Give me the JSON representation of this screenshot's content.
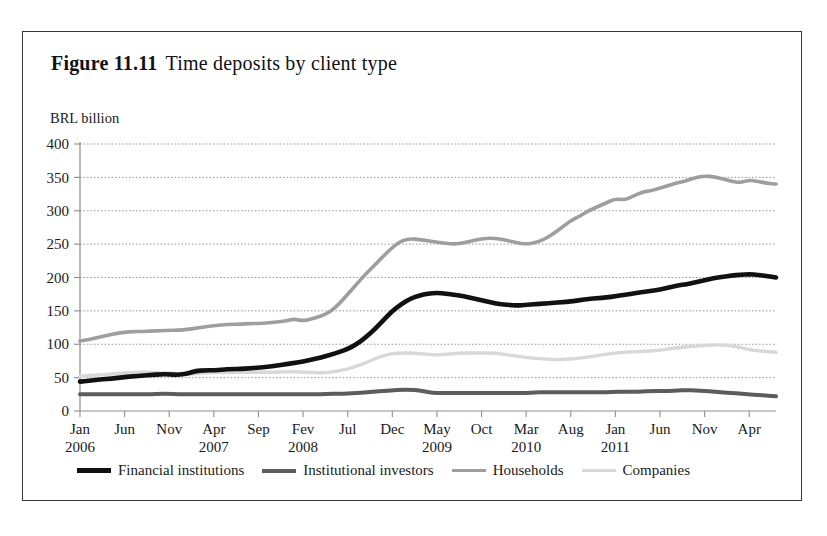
{
  "figure": {
    "number": "Figure 11.11",
    "caption": "Time deposits by client type"
  },
  "axis_unit_label": "BRL billion",
  "colors": {
    "financial_institutions": "#111111",
    "institutional_investors": "#5c5c5c",
    "households": "#9e9e9e",
    "companies": "#d8d8d8",
    "grid": "#9a9a9a",
    "axis": "#8d8d8d",
    "border": "#3a3a3a",
    "background": "#ffffff"
  },
  "legend": {
    "items": [
      {
        "label": "Financial institutions",
        "color": "#111111",
        "thickness": 4.5
      },
      {
        "label": "Institutional investors",
        "color": "#5c5c5c",
        "thickness": 4.0
      },
      {
        "label": "Households",
        "color": "#9e9e9e",
        "thickness": 3.5
      },
      {
        "label": "Companies",
        "color": "#d8d8d8",
        "thickness": 3.5
      }
    ]
  },
  "chart_data": {
    "type": "line",
    "title": "Time deposits by client type",
    "xlabel": "",
    "ylabel": "BRL billion",
    "ylim": [
      0,
      400
    ],
    "ytick_values": [
      0,
      50,
      100,
      150,
      200,
      250,
      300,
      350,
      400
    ],
    "grid": true,
    "legend_position": "bottom",
    "x_tick_labels": [
      {
        "month": "Jan",
        "year": "2006",
        "index": 0
      },
      {
        "month": "Jun",
        "year": "",
        "index": 5
      },
      {
        "month": "Nov",
        "year": "",
        "index": 10
      },
      {
        "month": "Apr",
        "year": "2007",
        "index": 15
      },
      {
        "month": "Sep",
        "year": "",
        "index": 20
      },
      {
        "month": "Fev",
        "year": "2008",
        "index": 25
      },
      {
        "month": "Jul",
        "year": "",
        "index": 30
      },
      {
        "month": "Dec",
        "year": "",
        "index": 35
      },
      {
        "month": "May",
        "year": "2009",
        "index": 40
      },
      {
        "month": "Oct",
        "year": "",
        "index": 45
      },
      {
        "month": "Mar",
        "year": "2010",
        "index": 50
      },
      {
        "month": "Aug",
        "year": "",
        "index": 55
      },
      {
        "month": "Jan",
        "year": "2011",
        "index": 60
      },
      {
        "month": "Jun",
        "year": "",
        "index": 65
      },
      {
        "month": "Nov",
        "year": "",
        "index": 70
      },
      {
        "month": "Apr",
        "year": "",
        "index": 75
      }
    ],
    "n_points": 79,
    "series": [
      {
        "name": "Financial institutions",
        "color": "#111111",
        "values": [
          44,
          45,
          47,
          48,
          49,
          51,
          52,
          53,
          54,
          55,
          55,
          54,
          56,
          60,
          61,
          61,
          62,
          63,
          63,
          64,
          65,
          66,
          68,
          70,
          72,
          74,
          77,
          80,
          84,
          88,
          93,
          100,
          110,
          122,
          136,
          150,
          160,
          168,
          173,
          176,
          177,
          176,
          174,
          172,
          169,
          166,
          163,
          160,
          159,
          158,
          159,
          160,
          161,
          162,
          163,
          164,
          166,
          168,
          169,
          170,
          172,
          174,
          176,
          178,
          180,
          182,
          185,
          188,
          190,
          193,
          196,
          199,
          201,
          203,
          204,
          205,
          204,
          202,
          200
        ]
      },
      {
        "name": "Institutional investors",
        "color": "#5c5c5c",
        "values": [
          25,
          25,
          25,
          25,
          25,
          25,
          25,
          25,
          25,
          26,
          26,
          25,
          25,
          25,
          25,
          25,
          25,
          25,
          25,
          25,
          25,
          25,
          25,
          25,
          25,
          25,
          25,
          25,
          26,
          26,
          26,
          27,
          28,
          29,
          30,
          31,
          32,
          32,
          31,
          28,
          27,
          27,
          27,
          27,
          27,
          27,
          27,
          27,
          27,
          27,
          27,
          28,
          28,
          28,
          28,
          28,
          28,
          28,
          28,
          28,
          29,
          29,
          29,
          29,
          30,
          30,
          30,
          31,
          31,
          31,
          30,
          29,
          28,
          27,
          26,
          25,
          24,
          23,
          22
        ]
      },
      {
        "name": "Households",
        "color": "#9e9e9e",
        "values": [
          105,
          107,
          110,
          113,
          116,
          118,
          119,
          119,
          120,
          120,
          121,
          121,
          122,
          124,
          126,
          128,
          129,
          130,
          130,
          131,
          131,
          132,
          133,
          135,
          138,
          135,
          138,
          142,
          148,
          160,
          175,
          190,
          205,
          218,
          232,
          245,
          255,
          258,
          257,
          255,
          253,
          251,
          250,
          252,
          255,
          258,
          259,
          258,
          255,
          252,
          250,
          252,
          257,
          265,
          275,
          285,
          292,
          300,
          306,
          312,
          318,
          316,
          322,
          328,
          330,
          334,
          338,
          342,
          345,
          350,
          352,
          351,
          348,
          344,
          342,
          346,
          344,
          341,
          340
        ]
      },
      {
        "name": "Companies",
        "color": "#d8d8d8",
        "values": [
          52,
          53,
          54,
          55,
          56,
          57,
          58,
          58,
          58,
          57,
          57,
          56,
          55,
          56,
          57,
          58,
          58,
          58,
          58,
          58,
          58,
          58,
          58,
          59,
          59,
          58,
          58,
          57,
          58,
          60,
          63,
          67,
          72,
          78,
          83,
          86,
          87,
          87,
          86,
          85,
          84,
          85,
          86,
          87,
          87,
          87,
          87,
          86,
          84,
          82,
          80,
          79,
          78,
          77,
          77,
          78,
          79,
          81,
          83,
          85,
          87,
          88,
          89,
          89,
          90,
          91,
          93,
          95,
          96,
          97,
          98,
          99,
          99,
          98,
          95,
          92,
          90,
          89,
          88
        ]
      }
    ]
  }
}
